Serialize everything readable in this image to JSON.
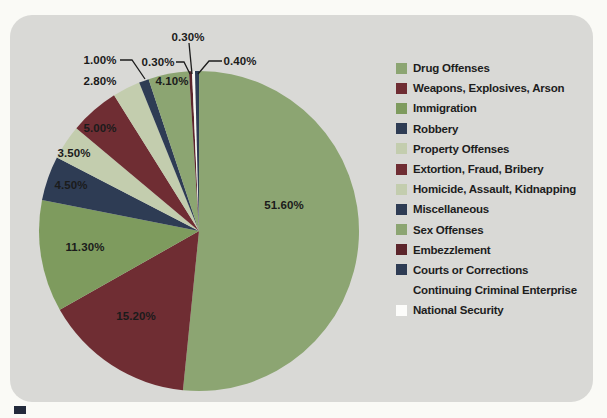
{
  "page": {
    "background": "#FAFAF6"
  },
  "panel": {
    "background": "#D9D9D6",
    "corner_radius_px": 22
  },
  "figure_marker": {
    "color": "#232A3B"
  },
  "chart_data": {
    "type": "pie",
    "title": "",
    "legend_position": "right",
    "grid": false,
    "total_percent": 100,
    "geometry": {
      "cx": 199,
      "cy": 231,
      "r": 160,
      "start_angle_deg_from_top": 0,
      "direction": "clockwise"
    },
    "slices": [
      {
        "name": "Drug Offenses",
        "value": 51.6,
        "label": "51.60%",
        "color": "#8CA572",
        "label_pos": [
          284,
          205
        ]
      },
      {
        "name": "Weapons, Explosives, Arson",
        "value": 15.2,
        "label": "15.20%",
        "color": "#6F2D33",
        "label_pos": [
          136,
          316
        ]
      },
      {
        "name": "Immigration",
        "value": 11.3,
        "label": "11.30%",
        "color": "#7E9B5E",
        "label_pos": [
          85,
          247
        ]
      },
      {
        "name": "Robbery",
        "value": 4.5,
        "label": "4.50%",
        "color": "#2E3C54",
        "label_pos": [
          71,
          185
        ]
      },
      {
        "name": "Property Offenses",
        "value": 3.5,
        "label": "3.50%",
        "color": "#C3CDAE",
        "label_pos": [
          74,
          153
        ]
      },
      {
        "name": "Extortion, Fraud, Bribery",
        "value": 5.0,
        "label": "5.00%",
        "color": "#6F2D33",
        "label_pos": [
          100,
          128
        ]
      },
      {
        "name": "Homicide, Assault, Kidnapping",
        "value": 2.8,
        "label": "2.80%",
        "color": "#C3CDAE",
        "label_pos": [
          100,
          81
        ]
      },
      {
        "name": "Miscellaneous",
        "value": 1.0,
        "label": "1.00%",
        "color": "#2E3C54",
        "label_pos": [
          100,
          60
        ],
        "callout": [
          [
            120,
            60
          ],
          [
            132,
            60
          ],
          [
            145,
            79
          ]
        ]
      },
      {
        "name": "Sex Offenses",
        "value": 4.1,
        "label": "4.10%",
        "color": "#8CA572",
        "label_pos": [
          172,
          81
        ]
      },
      {
        "name": "Embezzlement",
        "value": 0.3,
        "label": "0.30%",
        "color": "#5C252B",
        "label_pos": [
          158,
          62
        ],
        "callout": [
          [
            176,
            62
          ],
          [
            184,
            62
          ],
          [
            190,
            74
          ]
        ]
      },
      {
        "name": "Continuing Criminal Enterprise",
        "value": 0.3,
        "label": "0.30%",
        "color": "#F7F7F2",
        "label_pos": [
          188,
          37
        ],
        "callout": [
          [
            189,
            43
          ],
          [
            192,
            74
          ]
        ]
      },
      {
        "name": "Courts or Corrections",
        "value": 0.4,
        "label": "0.40%",
        "color": "#2E3C54",
        "label_pos": [
          240,
          61
        ],
        "callout": [
          [
            222,
            61
          ],
          [
            209,
            61
          ],
          [
            198,
            74
          ]
        ]
      },
      {
        "name": "National Security",
        "value": 0.0,
        "label": "",
        "color": "#FCFCFA",
        "label_pos": null
      }
    ],
    "legend": [
      {
        "label": "Drug Offenses",
        "swatch": "#8CA572"
      },
      {
        "label": "Weapons, Explosives, Arson",
        "swatch": "#6F2D33"
      },
      {
        "label": "Immigration",
        "swatch": "#7E9B5E"
      },
      {
        "label": "Robbery",
        "swatch": "#2E3C54"
      },
      {
        "label": "Property Offenses",
        "swatch": "#C3CDAE"
      },
      {
        "label": "Extortion, Fraud, Bribery",
        "swatch": "#6F2D33"
      },
      {
        "label": "Homicide, Assault, Kidnapping",
        "swatch": "#C3CDAE"
      },
      {
        "label": "Miscellaneous",
        "swatch": "#2E3C54"
      },
      {
        "label": "Sex Offenses",
        "swatch": "#8CA572"
      },
      {
        "label": "Embezzlement",
        "swatch": "#5C252B"
      },
      {
        "label": "Courts or Corrections",
        "swatch": "#2E3C54"
      },
      {
        "label": "Continuing Criminal Enterprise",
        "swatch": "none"
      },
      {
        "label": "National Security",
        "swatch": "#FCFCFA"
      }
    ],
    "callout_line_color": "#1C1C1C"
  }
}
